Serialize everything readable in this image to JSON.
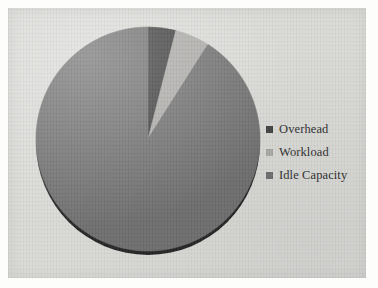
{
  "chart_data": {
    "type": "pie",
    "title": "",
    "subtitle": "",
    "xlabel": "",
    "ylabel": "",
    "grid": false,
    "legend_position": "right",
    "categories": [
      "Overhead",
      "Workload",
      "Idle Capacity"
    ],
    "values": [
      4,
      5,
      91
    ],
    "units": "percent",
    "start_angle_deg": 0,
    "direction": "clockwise",
    "slices": [
      {
        "label": "Overhead",
        "value": 4,
        "percent": 4,
        "color": "#3d3d3d",
        "start_angle_deg": 0,
        "end_angle_deg": 14.4
      },
      {
        "label": "Workload",
        "value": 5,
        "percent": 5,
        "color": "#aaa9a6",
        "start_angle_deg": 14.4,
        "end_angle_deg": 32.4
      },
      {
        "label": "Idle Capacity",
        "value": 91,
        "percent": 91,
        "color": "#6e6e6e",
        "start_angle_deg": 32.4,
        "end_angle_deg": 360
      }
    ]
  },
  "legend": {
    "items": [
      {
        "label": "Overhead",
        "color": "#3d3d3d"
      },
      {
        "label": "Workload",
        "color": "#aaa9a6"
      },
      {
        "label": "Idle Capacity",
        "color": "#6e6e6e"
      }
    ]
  },
  "colors": {
    "page_background": "#fdfdfc",
    "plot_background": "#d9d9d6",
    "overhead": "#3d3d3d",
    "workload": "#aaa9a6",
    "idle_capacity": "#6e6e6e",
    "pie_shadow": "#141414",
    "legend_text": "#2d2d2d"
  },
  "geometry": {
    "pie_center_x": 140,
    "pie_center_y": 131,
    "pie_radius": 112
  }
}
